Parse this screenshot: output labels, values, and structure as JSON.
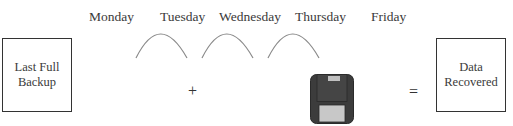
{
  "days": [
    "Monday",
    "Tuesday",
    "Wednesday",
    "Thursday",
    "Friday"
  ],
  "left_box": {
    "line1": "Last Full",
    "line2": "Backup"
  },
  "right_box": {
    "line1": "Data",
    "line2": "Recovered"
  },
  "operators": {
    "plus": "+",
    "equals": "="
  },
  "icons": {
    "arc": "arc-connector-icon",
    "disk": "floppy-disk-icon"
  },
  "colors": {
    "stroke": "#333333",
    "arc": "#888888",
    "disk_body": "#3c3c3c",
    "disk_label": "#c8c8c8"
  }
}
